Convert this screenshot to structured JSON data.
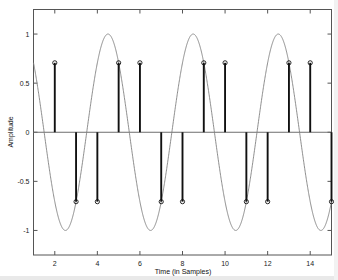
{
  "chart_data": {
    "type": "line",
    "title": "",
    "xlabel": "Time (in Samples)",
    "ylabel": "Amplitude",
    "xlim": [
      1,
      15
    ],
    "ylim": [
      -1.25,
      1.25
    ],
    "grid": false,
    "legend": null,
    "xticks": [
      2,
      4,
      6,
      8,
      10,
      12,
      14
    ],
    "xtick_labels": [
      "2",
      "4",
      "6",
      "8",
      "10",
      "12",
      "14"
    ],
    "yticks": [
      1,
      0.5,
      0,
      -0.5,
      -1
    ],
    "ytick_labels": [
      "1",
      "0.5",
      "0",
      "-0.5",
      "-1"
    ],
    "series": [
      {
        "name": "continuous sine",
        "kind": "line",
        "color": "#808080",
        "description": "y = sin(pi*t/2 + pi/4), period 4 samples, amplitude 1",
        "amplitude": 1,
        "period_samples": 4,
        "phase_deg": 45,
        "peaks_at": [
          1.5,
          5.5,
          9.5,
          13.5
        ],
        "troughs_at": [
          3.5,
          7.5,
          11.5
        ]
      },
      {
        "name": "sampled stems",
        "kind": "stem",
        "color": "#111111",
        "marker": "circle",
        "x": [
          2,
          3,
          4,
          5,
          6,
          7,
          8,
          9,
          10,
          11,
          12,
          13,
          14,
          15
        ],
        "values": [
          0.707,
          -0.707,
          -0.707,
          0.707,
          0.707,
          -0.707,
          -0.707,
          0.707,
          0.707,
          -0.707,
          -0.707,
          0.707,
          0.707,
          -0.707
        ]
      }
    ]
  },
  "figure": {
    "xlabel": "Time (in Samples)",
    "ylabel": "Amplitude"
  }
}
